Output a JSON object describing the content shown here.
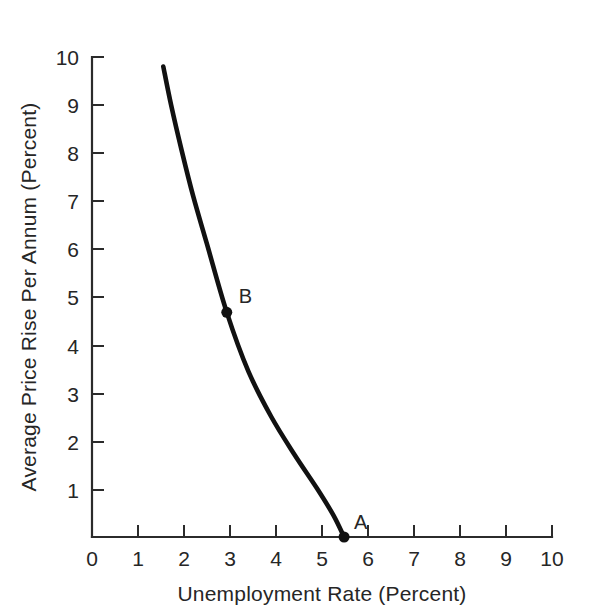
{
  "chart_data": {
    "type": "line",
    "title": "",
    "xlabel": "Unemployment Rate (Percent)",
    "ylabel": "Average Price Rise Per Annum (Percent)",
    "xlim": [
      0,
      10
    ],
    "ylim": [
      0,
      10
    ],
    "grid": false,
    "legend": "none",
    "x_ticks": [
      "0",
      "1",
      "2",
      "3",
      "4",
      "5",
      "6",
      "7",
      "8",
      "9",
      "10"
    ],
    "y_ticks": [
      "1",
      "2",
      "3",
      "4",
      "5",
      "6",
      "7",
      "8",
      "9",
      "10"
    ],
    "series": [
      {
        "name": "Phillips curve",
        "color": "#111111",
        "x": [
          1.55,
          1.72,
          1.95,
          2.2,
          2.5,
          2.93,
          3.4,
          3.9,
          4.4,
          4.9,
          5.25,
          5.48
        ],
        "y": [
          9.8,
          9.0,
          8.05,
          7.1,
          6.1,
          4.68,
          3.45,
          2.5,
          1.72,
          1.0,
          0.45,
          0.0
        ]
      }
    ],
    "annotations": [
      {
        "label": "B",
        "x": 2.93,
        "y": 4.68,
        "marker": true
      },
      {
        "label": "A",
        "x": 5.48,
        "y": 0.0,
        "marker": true
      }
    ]
  },
  "axes": {
    "x_tick_0": "0",
    "x_tick_1": "1",
    "x_tick_2": "2",
    "x_tick_3": "3",
    "x_tick_4": "4",
    "x_tick_5": "5",
    "x_tick_6": "6",
    "x_tick_7": "7",
    "x_tick_8": "8",
    "x_tick_9": "9",
    "x_tick_10": "10",
    "y_tick_1": "1",
    "y_tick_2": "2",
    "y_tick_3": "3",
    "y_tick_4": "4",
    "y_tick_5": "5",
    "y_tick_6": "6",
    "y_tick_7": "7",
    "y_tick_8": "8",
    "y_tick_9": "9",
    "y_tick_10": "10",
    "x_title": "Unemployment Rate (Percent)",
    "y_title": "Average Price Rise Per Annum (Percent)"
  },
  "points": {
    "a_label": "A",
    "b_label": "B"
  }
}
